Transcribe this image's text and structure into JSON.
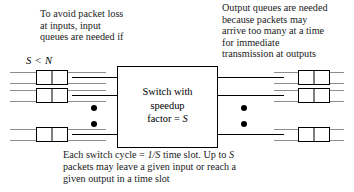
{
  "diagram": {
    "notes": {
      "left": "To avoid packet loss\nat inputs, input\nqueues are needed if",
      "left_condition": "S < N",
      "right": "Output queues are needed\nbecause packets may\narrive too many at a time\nfor immediate\ntransmission at outputs",
      "bottom_line1_pre": "Each switch cycle = ",
      "bottom_line1_ital": "1/S",
      "bottom_line1_post": " time slot. Up to ",
      "bottom_line1_ital2": "S",
      "bottom_line2": "packets may leave a given input or reach a",
      "bottom_line3": "given output in a time slot"
    },
    "switch": {
      "line1": "Switch with",
      "line2": "speedup",
      "line3_pre": "factor = ",
      "line3_ital": "S"
    },
    "input_queues": [
      {
        "id": "input-queue-1",
        "cells": 2
      },
      {
        "id": "input-queue-2",
        "cells": 2
      },
      {
        "id": "input-queue-3",
        "cells": 2
      }
    ],
    "output_queues": [
      {
        "id": "output-queue-1",
        "cells": 2
      },
      {
        "id": "output-queue-2",
        "cells": 2
      },
      {
        "id": "output-queue-3",
        "cells": 2
      }
    ],
    "ellipsis": {
      "left_dots": 2,
      "right_dots": 2
    },
    "colors": {
      "stroke": "#000000",
      "thin_line": "#8c8c8c",
      "background": "#ffffff",
      "text": "#1a1a1a"
    }
  }
}
